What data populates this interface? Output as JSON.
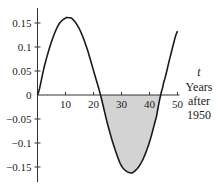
{
  "chart_data": {
    "type": "area",
    "title": "",
    "xlabel": [
      "t",
      "Years",
      "after",
      "1950"
    ],
    "ylabel": "",
    "xlim": [
      0,
      50
    ],
    "ylim": [
      -0.18,
      0.18
    ],
    "grid": false,
    "legend": null,
    "x_ticks": [
      10,
      20,
      30,
      40,
      50
    ],
    "x_tick_labels": [
      "10",
      "20",
      "30",
      "40",
      "50"
    ],
    "y_ticks": [
      0.15,
      0.1,
      0.05,
      0,
      -0.05,
      -0.1,
      -0.15
    ],
    "y_tick_labels": [
      "0.15",
      "0.1",
      "0.05",
      "0",
      "−0.05",
      "−0.1",
      "−0.15"
    ],
    "series": [
      {
        "name": "curve",
        "x": [
          0,
          2.5,
          5,
          7.5,
          10,
          11,
          12.5,
          15,
          17.5,
          20,
          22.5,
          25,
          27.5,
          30,
          33,
          35,
          37.5,
          40,
          42.5,
          44,
          45,
          47.5,
          50
        ],
        "values": [
          0,
          0.061,
          0.111,
          0.146,
          0.16,
          0.161,
          0.158,
          0.137,
          0.1,
          0.051,
          0.0,
          -0.06,
          -0.11,
          -0.148,
          -0.162,
          -0.157,
          -0.136,
          -0.098,
          -0.045,
          0.0,
          0.025,
          0.082,
          0.133
        ]
      }
    ],
    "shaded_region": {
      "x_from": 22.5,
      "x_to": 44,
      "description": "area between curve and t-axis where curve is negative",
      "color": "#d3d3d3"
    },
    "annotations": []
  },
  "style": {
    "curve_color": "#1a1a1a",
    "axis_color": "#333333",
    "fill_color": "#d3d3d3"
  }
}
